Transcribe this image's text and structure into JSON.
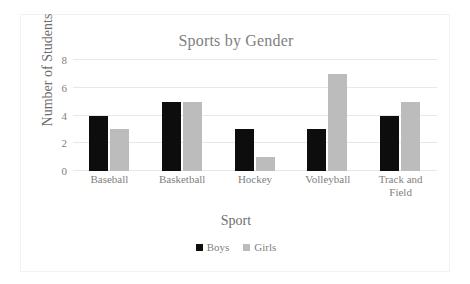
{
  "chart_data": {
    "type": "bar",
    "title": "Sports by Gender",
    "xlabel": "Sport",
    "ylabel": "Number of Students",
    "categories": [
      "Baseball",
      "Basketball",
      "Hockey",
      "Volleyball",
      "Track and Field"
    ],
    "category_labels": [
      {
        "line1": "Baseball",
        "line2": ""
      },
      {
        "line1": "Basketball",
        "line2": ""
      },
      {
        "line1": "Hockey",
        "line2": ""
      },
      {
        "line1": "Volleyball",
        "line2": ""
      },
      {
        "line1": "Track and",
        "line2": "Field"
      }
    ],
    "series": [
      {
        "name": "Boys",
        "color": "#0d0d0d",
        "values": [
          4,
          5,
          3,
          3,
          4
        ]
      },
      {
        "name": "Girls",
        "color": "#bcbcbc",
        "values": [
          3,
          5,
          1,
          7,
          5
        ]
      }
    ],
    "ylim": [
      0,
      8
    ],
    "yticks": [
      0,
      2,
      4,
      6,
      8
    ],
    "ytick_labels": [
      "0",
      "2",
      "4",
      "6",
      "8"
    ],
    "grid": true,
    "grid_axis": "y",
    "legend_position": "bottom",
    "legend": [
      "Boys",
      "Girls"
    ],
    "colors": {
      "title": "#808080",
      "axis_text": "#808080",
      "axis_title": "#6e6e6e",
      "gridline": "#e8e8e8",
      "border": "#f2f2f2",
      "background": "#ffffff"
    }
  }
}
